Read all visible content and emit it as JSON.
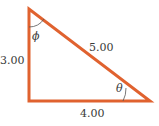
{
  "diagram": {
    "type": "right-triangle",
    "colors": {
      "triangle_stroke": "#e0622f",
      "arc_stroke": "#555555",
      "text": "#3a3a3a"
    },
    "sides": {
      "vertical_leg": "3.00",
      "horizontal_leg": "4.00",
      "hypotenuse": "5.00"
    },
    "angles": {
      "top_angle": "ϕ",
      "right_angle": "θ"
    }
  }
}
